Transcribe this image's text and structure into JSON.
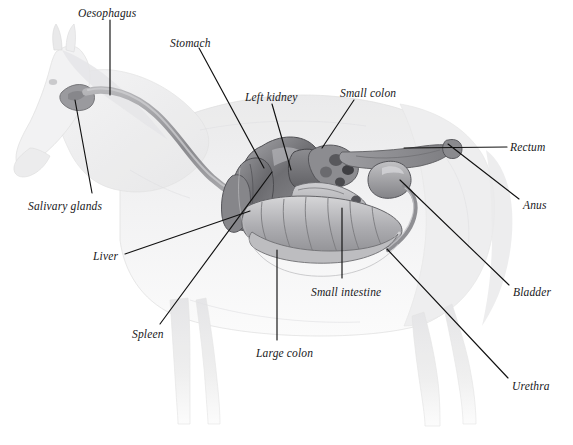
{
  "figure": {
    "style": "pencil-grayscale-anatomical-illustration",
    "background_color": "#ffffff",
    "label_color": "#18181a",
    "leader_line_color": "#111111"
  },
  "labels": [
    {
      "id": "oesophagus",
      "text": "Oesophagus",
      "x": 78,
      "y": 8,
      "anchor": "start"
    },
    {
      "id": "stomach",
      "text": "Stomach",
      "x": 170,
      "y": 38,
      "anchor": "start"
    },
    {
      "id": "left-kidney",
      "text": "Left kidney",
      "x": 245,
      "y": 92,
      "anchor": "start"
    },
    {
      "id": "small-colon",
      "text": "Small colon",
      "x": 340,
      "y": 88,
      "anchor": "start"
    },
    {
      "id": "rectum",
      "text": "Rectum",
      "x": 510,
      "y": 142,
      "anchor": "start"
    },
    {
      "id": "anus",
      "text": "Anus",
      "x": 523,
      "y": 200,
      "anchor": "start"
    },
    {
      "id": "salivary-glands",
      "text": "Salivary glands",
      "x": 28,
      "y": 201,
      "anchor": "start"
    },
    {
      "id": "liver",
      "text": "Liver",
      "x": 93,
      "y": 251,
      "anchor": "start"
    },
    {
      "id": "spleen",
      "text": "Spleen",
      "x": 132,
      "y": 329,
      "anchor": "start"
    },
    {
      "id": "large-colon",
      "text": "Large colon",
      "x": 256,
      "y": 348,
      "anchor": "start"
    },
    {
      "id": "small-intestine",
      "text": "Small intestine",
      "x": 311,
      "y": 287,
      "anchor": "start"
    },
    {
      "id": "bladder",
      "text": "Bladder",
      "x": 513,
      "y": 287,
      "anchor": "start"
    },
    {
      "id": "urethra",
      "text": "Urethra",
      "x": 512,
      "y": 381,
      "anchor": "start"
    }
  ],
  "leader_lines": [
    {
      "id": "oesophagus-leader",
      "points": "110,20 110,95"
    },
    {
      "id": "stomach-leader",
      "points": "199,48 264,168"
    },
    {
      "id": "left-kidney-leader",
      "points": "272,104 291,170"
    },
    {
      "id": "small-colon-leader",
      "points": "354,100 322,148"
    },
    {
      "id": "rectum-leader",
      "points": "507,147 404,148"
    },
    {
      "id": "anus-leader",
      "points": "519,199 448,144"
    },
    {
      "id": "salivary-glands-leader",
      "points": "92,193 75,100"
    },
    {
      "id": "liver-leader",
      "points": "125,254 250,211"
    },
    {
      "id": "spleen-leader",
      "points": "160,324 272,172"
    },
    {
      "id": "large-colon-leader",
      "points": "277,340 277,250"
    },
    {
      "id": "small-intestine-leader",
      "points": "342,278 342,208"
    },
    {
      "id": "bladder-leader",
      "points": "509,285 400,180"
    },
    {
      "id": "urethra-leader",
      "points": "508,378 387,249"
    }
  ],
  "organs": [
    {
      "id": "oesophagus",
      "name": "Oesophagus",
      "tone": "#8d8d8f"
    },
    {
      "id": "salivary-glands",
      "name": "Salivary glands",
      "tone": "#9a9a9c"
    },
    {
      "id": "stomach",
      "name": "Stomach",
      "tone": "#818183"
    },
    {
      "id": "left-kidney",
      "name": "Left kidney",
      "tone": "#6f6f72"
    },
    {
      "id": "liver",
      "name": "Liver",
      "tone": "#7b7b7e"
    },
    {
      "id": "spleen",
      "name": "Spleen",
      "tone": "#86868a"
    },
    {
      "id": "small-colon",
      "name": "Small colon",
      "tone": "#9b9b9e"
    },
    {
      "id": "small-intestine",
      "name": "Small intestine",
      "tone": "#a4a4a7"
    },
    {
      "id": "large-colon",
      "name": "Large colon",
      "tone": "#b0b0b3"
    },
    {
      "id": "rectum",
      "name": "Rectum",
      "tone": "#9c9c9f"
    },
    {
      "id": "anus",
      "name": "Anus",
      "tone": "#8a8a8d"
    },
    {
      "id": "bladder",
      "name": "Bladder",
      "tone": "#9e9ea1"
    },
    {
      "id": "urethra",
      "name": "Urethra",
      "tone": "#8f8f92"
    }
  ]
}
